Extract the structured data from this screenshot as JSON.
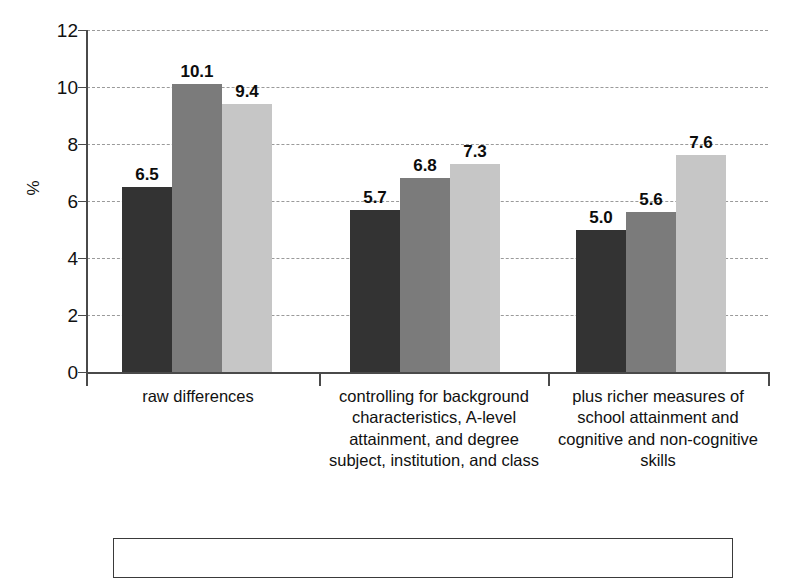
{
  "chart_data": {
    "type": "bar",
    "title": "",
    "subtitle": "",
    "xlabel": "",
    "ylabel": "%",
    "ylim": [
      0,
      12
    ],
    "ytick_values": [
      0,
      2,
      4,
      6,
      8,
      10,
      12
    ],
    "ytick_labels": [
      "0",
      "2",
      "4",
      "6",
      "8",
      "10",
      "12"
    ],
    "grid": true,
    "grid_style": "dashed",
    "legend_position": "bottom",
    "legend_entries": [],
    "categories": [
      "raw differences",
      "controlling for background characteristics, A-level attainment, and degree subject, institution, and class",
      "plus richer measures of school attainment and cognitive and non-cognitive skills"
    ],
    "series": [
      {
        "name": "series-1",
        "color": "#333333",
        "values": [
          6.5,
          5.7,
          5.0
        ],
        "labels": [
          "6.5",
          "5.7",
          "5.0"
        ]
      },
      {
        "name": "series-2",
        "color": "#7b7b7b",
        "values": [
          10.1,
          6.8,
          5.6
        ],
        "labels": [
          "10.1",
          "6.8",
          "5.6"
        ]
      },
      {
        "name": "series-3",
        "color": "#c6c6c6",
        "values": [
          9.4,
          7.3,
          7.6
        ],
        "labels": [
          "9.4",
          "7.3",
          "7.6"
        ]
      }
    ]
  },
  "axis": {
    "y_title": "%",
    "ticks": [
      "12",
      "10",
      "8",
      "6",
      "4",
      "2",
      "0"
    ]
  },
  "category_labels": [
    "raw differences",
    "controlling for background characteristics, A-level attainment, and degree subject, institution, and class",
    "plus richer measures of school attainment and cognitive and non-cognitive skills"
  ],
  "bar_value_labels": [
    "6.5",
    "10.1",
    "9.4",
    "5.7",
    "6.8",
    "7.3",
    "5.0",
    "5.6",
    "7.6"
  ],
  "colors": {
    "series_1": "#333333",
    "series_2": "#7b7b7b",
    "series_3": "#c6c6c6",
    "axis": "#4a4a4a",
    "grid": "#9a9a9a",
    "text": "#111111",
    "background": "#ffffff"
  }
}
